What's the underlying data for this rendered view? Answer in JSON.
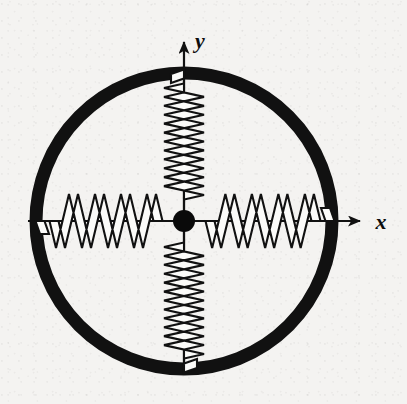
{
  "figure": {
    "background_color": "#f4f3f1",
    "ink_color": "#111111",
    "paper_texture": "speckled scanned halftone"
  },
  "axes": {
    "x_label": "x",
    "y_label": "y",
    "x_axis_name": "horizontal axis",
    "y_axis_name": "vertical axis",
    "origin": {
      "x": 184,
      "y": 221
    },
    "x_arrow_tip": {
      "x": 366,
      "y": 221
    },
    "y_arrow_tip": {
      "x": 184,
      "y": 36
    },
    "x_axis_start": {
      "x": 28,
      "y": 221
    },
    "y_axis_start": {
      "x": 184,
      "y": 372
    },
    "label_color": "#0d0d0d",
    "line_color": "#111111",
    "line_width": 2.2
  },
  "ring": {
    "name": "rigid circular ring",
    "center": {
      "x": 184,
      "y": 221
    },
    "radius": 148,
    "stroke_width": 13,
    "color": "#111111"
  },
  "mass": {
    "name": "point mass",
    "center": {
      "x": 184,
      "y": 221
    },
    "radius": 11,
    "color": "#0a0a0a"
  },
  "springs": [
    {
      "id": "spring-left",
      "label": "left spring",
      "direction": "-x",
      "attach_inner": {
        "x": 172,
        "y": 221
      },
      "attach_ring": {
        "x": 40,
        "y": 221
      },
      "coils": 4,
      "amplitude": 27,
      "band_width": 9
    },
    {
      "id": "spring-right",
      "label": "right spring",
      "direction": "+x",
      "attach_inner": {
        "x": 196,
        "y": 221
      },
      "attach_ring": {
        "x": 330,
        "y": 221
      },
      "coils": 4,
      "amplitude": 27,
      "band_width": 9
    },
    {
      "id": "spring-top",
      "label": "top spring",
      "direction": "+y",
      "attach_inner": {
        "x": 184,
        "y": 209
      },
      "attach_ring": {
        "x": 184,
        "y": 74
      },
      "coils": 6,
      "amplitude": 20,
      "band_width": 9
    },
    {
      "id": "spring-bottom",
      "label": "bottom spring",
      "direction": "-y",
      "attach_inner": {
        "x": 184,
        "y": 233
      },
      "attach_ring": {
        "x": 184,
        "y": 368
      },
      "coils": 6,
      "amplitude": 20,
      "band_width": 9
    }
  ],
  "chart_data": {
    "type": "diagram",
    "xlabel": "x",
    "ylabel": "y",
    "elements": [
      "rigid circular ring (thick black annulus)",
      "central point mass (filled black disc at origin)",
      "horizontal spring to the left wall",
      "horizontal spring to the right wall",
      "vertical spring to the top wall",
      "vertical spring to the bottom wall",
      "x-axis with arrowhead pointing right",
      "y-axis with arrowhead pointing up"
    ]
  }
}
